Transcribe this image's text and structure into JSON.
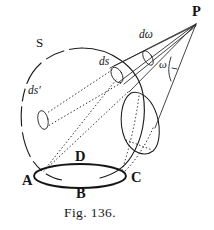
{
  "figure": {
    "caption": "Fig. 136.",
    "background_color": "#ffffff",
    "ink_color": "#1a1a1a",
    "width": 214,
    "height": 230
  },
  "labels": {
    "point_P": "P",
    "point_A": "A",
    "point_B": "B",
    "point_C": "C",
    "point_D": "D",
    "surface_S": "S",
    "element_ds": "ds",
    "element_ds_prime": "ds′",
    "solid_angle_domega": "dω",
    "angle_omega": "ω"
  },
  "label_positions": {
    "point_P": {
      "x": 192,
      "y": 10
    },
    "surface_S": {
      "x": 38,
      "y": 42
    },
    "element_ds": {
      "x": 101,
      "y": 62
    },
    "element_ds_prime": {
      "x": 30,
      "y": 88
    },
    "solid_angle_domega": {
      "x": 142,
      "y": 33
    },
    "angle_omega": {
      "x": 160,
      "y": 63
    },
    "point_A": {
      "x": 25,
      "y": 182
    },
    "point_B": {
      "x": 79,
      "y": 196
    },
    "point_C": {
      "x": 134,
      "y": 180
    },
    "point_D": {
      "x": 78,
      "y": 158
    },
    "caption": {
      "x": 66,
      "y": 207
    }
  },
  "geometry": {
    "external_point": {
      "x": 196,
      "y": 24
    },
    "sphere_center": {
      "x": 82,
      "y": 110
    },
    "sphere_radius": 62,
    "base_ellipse": {
      "cx": 80,
      "cy": 176,
      "rx": 46,
      "ry": 12
    },
    "ds_ellipse": {
      "cx": 118,
      "cy": 73,
      "rx": 5,
      "ry": 8,
      "rotate": -28
    },
    "ds_prime_ellipse": {
      "cx": 42,
      "cy": 119,
      "rx": 5,
      "ry": 9,
      "rotate": -14
    },
    "cone_cross_section": {
      "cx": 142,
      "cy": 113,
      "rx": 14,
      "ry": 24,
      "rotate": 12
    }
  }
}
